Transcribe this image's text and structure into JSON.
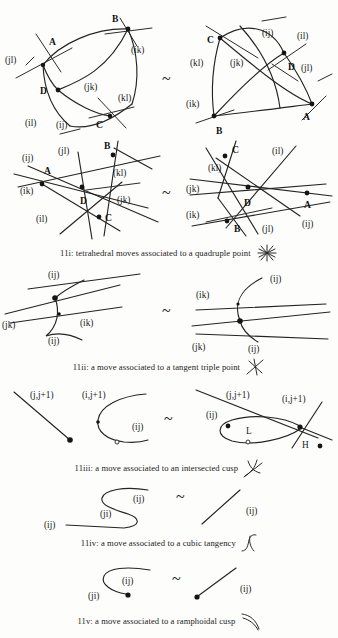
{
  "document": {
    "kind": "mathematical-figure-page",
    "ink_color": "#242424",
    "paper_color": "#fdfdfb",
    "equivalence_symbol": "~"
  },
  "figures": [
    {
      "id": "11i",
      "caption": "11i: tetrahedral moves associated to a quadruple point",
      "caption_icon": "asterisk-star-icon",
      "rows": [
        {
          "left": {
            "vertex_labels": [
              "A",
              "B",
              "C",
              "D"
            ],
            "edge_labels": [
              "(jl)",
              "(ik)",
              "(jk)",
              "(kl)",
              "(il)",
              "(ij)"
            ]
          },
          "right": {
            "vertex_labels": [
              "C",
              "D",
              "A",
              "B"
            ],
            "edge_labels": [
              "(ij)",
              "(il)",
              "(kl)",
              "(jk)",
              "(jl)",
              "(ik)"
            ]
          }
        },
        {
          "left": {
            "vertex_labels": [
              "A",
              "B",
              "C",
              "D"
            ],
            "edge_labels": [
              "(ij)",
              "(jl)",
              "(kl)",
              "(ik)",
              "(jk)",
              "(il)"
            ]
          },
          "right": {
            "vertex_labels": [
              "C",
              "D",
              "A",
              "B"
            ],
            "edge_labels": [
              "(il)",
              "(kl)",
              "(jk)",
              "(ik)",
              "(jl)",
              "(ij)"
            ]
          }
        }
      ]
    },
    {
      "id": "11ii",
      "caption": "11ii: a move  associated to a tangent triple point",
      "caption_icon": "crossed-lines-icon",
      "left": {
        "labels": [
          "(ij)",
          "(jk)",
          "(ik)",
          "(ij)"
        ]
      },
      "right": {
        "labels": [
          "(ij)",
          "(ik)",
          "(jk)",
          "(ij)"
        ]
      }
    },
    {
      "id": "11iii",
      "caption": "11iii: a move associated to an intersected cusp",
      "caption_icon": "cusp-branch-icon",
      "left": {
        "labels": [
          "(j,j+1)",
          "(i,j+1)",
          "(ij)"
        ]
      },
      "right": {
        "labels": [
          "(j,j+1)",
          "(i,j+1)",
          "(ij)",
          "L",
          "H"
        ]
      }
    },
    {
      "id": "11iv",
      "caption": "11iv: a move associated to a cubic tangency",
      "caption_icon": "s-curve-icon",
      "left": {
        "labels": [
          "(ij)",
          "(ji)",
          "(ij)"
        ]
      },
      "right": {
        "labels": [
          "(ij)"
        ]
      }
    },
    {
      "id": "11v",
      "caption": "11v: a move associated to a ramphoidal cusp",
      "caption_icon": "ramphoid-arc-icon",
      "left": {
        "labels": [
          "(ij)",
          "(ji)"
        ]
      },
      "right": {
        "labels": [
          "(ij)"
        ]
      }
    }
  ]
}
